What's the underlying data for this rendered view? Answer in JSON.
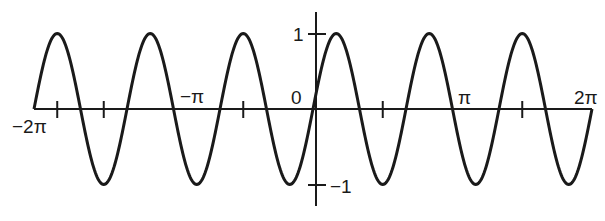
{
  "chart_data": {
    "type": "line",
    "title": "",
    "function": "y = sin(3x)",
    "xlabel": "",
    "ylabel": "",
    "xlim": [
      -6.2832,
      6.2832
    ],
    "ylim": [
      -1,
      1
    ],
    "grid": false,
    "legend": null,
    "x_tick_labels": [
      {
        "value": -6.2832,
        "label": "−2π"
      },
      {
        "value": -3.1416,
        "label": "−π"
      },
      {
        "value": 0,
        "label": "0"
      },
      {
        "value": 3.1416,
        "label": "π"
      },
      {
        "value": 6.2832,
        "label": "2π"
      }
    ],
    "x_unlabeled_ticks": [
      -5.76,
      -4.7124,
      -1.5708,
      1.5708,
      4.7124
    ],
    "y_tick_labels": [
      {
        "value": 1,
        "label": "1"
      },
      {
        "value": -1,
        "label": "−1"
      }
    ],
    "series": [
      {
        "name": "sin(3x)",
        "color": "#1a1a1a",
        "x": [
          -6.2832,
          -5.7596,
          -5.236,
          -4.7124,
          -4.1888,
          -3.6652,
          -3.1416,
          -2.618,
          -2.0944,
          -1.5708,
          -1.0472,
          -0.5236,
          0,
          0.5236,
          1.0472,
          1.5708,
          2.0944,
          2.618,
          3.1416,
          3.6652,
          4.1888,
          4.7124,
          5.236,
          5.7596,
          6.2832
        ],
        "values": [
          0,
          1,
          0,
          -1,
          0,
          1,
          0,
          -1,
          0,
          1,
          0,
          -1,
          0,
          1,
          0,
          -1,
          0,
          1,
          0,
          -1,
          0,
          1,
          0,
          -1,
          0
        ]
      }
    ]
  },
  "labels": {
    "x_neg_2pi": "−2π",
    "x_neg_pi": "−π",
    "x_zero": "0",
    "x_pi": "π",
    "x_2pi": "2π",
    "y_one": "1",
    "y_neg_one": "−1"
  }
}
